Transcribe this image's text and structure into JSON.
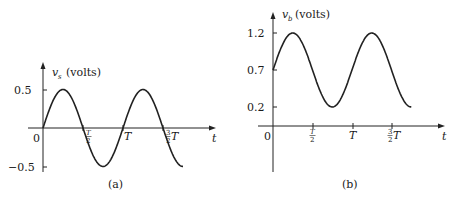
{
  "chart_data": [
    {
      "type": "line",
      "panel_label": "(a)",
      "title": "",
      "ylabel": "v_s (volts)",
      "ylabel_var": "v",
      "ylabel_sub": "s",
      "ylabel_unit": "(volts)",
      "xlabel": "t",
      "x_ticks": [
        "0",
        "T/2",
        "T",
        "3/2 T"
      ],
      "y_ticks": [
        "0.5",
        "-0.5"
      ],
      "ylim": [
        -0.5,
        0.5
      ],
      "xlim": [
        0,
        1.75
      ],
      "function": "0.5*sin(2*pi*t/T)",
      "amplitude": 0.5,
      "offset": 0,
      "period": "T",
      "x": [
        0,
        0.25,
        0.5,
        0.75,
        1.0,
        1.25,
        1.5,
        1.75
      ],
      "values": [
        0,
        0.5,
        0,
        -0.5,
        0,
        0.5,
        0,
        -0.5
      ],
      "grid": false
    },
    {
      "type": "line",
      "panel_label": "(b)",
      "title": "",
      "ylabel": "v_b (volts)",
      "ylabel_var": "v",
      "ylabel_sub": "b",
      "ylabel_unit": "(volts)",
      "xlabel": "t",
      "x_ticks": [
        "0",
        "T/2",
        "T",
        "3/2 T"
      ],
      "y_ticks": [
        "1.2",
        "0.7",
        "0.2"
      ],
      "ylim": [
        0,
        1.2
      ],
      "xlim": [
        0,
        1.75
      ],
      "function": "0.7 + 0.5*sin(2*pi*t/T)",
      "amplitude": 0.5,
      "offset": 0.7,
      "period": "T",
      "x": [
        0,
        0.25,
        0.5,
        0.75,
        1.0,
        1.25,
        1.5,
        1.75
      ],
      "values": [
        0.7,
        1.2,
        0.7,
        0.2,
        0.7,
        1.2,
        0.7,
        0.2
      ],
      "grid": false
    }
  ],
  "labels": {
    "zero": "0",
    "t": "t",
    "T": "T",
    "half_num": "T",
    "half_den": "2",
    "three_num": "3",
    "three_den": "2",
    "volts": "(volts)",
    "v": "v",
    "sub_a": "s",
    "sub_b": "b",
    "a_y_pos": "0.5",
    "a_y_neg": "−0.5",
    "b_y_top": "1.2",
    "b_y_mid": "0.7",
    "b_y_low": "0.2",
    "caption_a": "(a)",
    "caption_b": "(b)"
  }
}
